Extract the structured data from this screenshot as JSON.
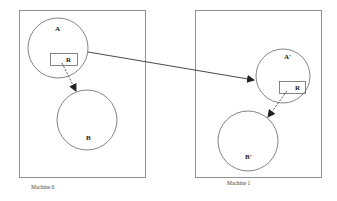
{
  "machines": [
    {
      "caption": "Machine 0",
      "process_top": "A",
      "process_bottom": "B",
      "ref": "R"
    },
    {
      "caption": "Machine 1",
      "process_top": "A'",
      "process_bottom": "B'",
      "ref": "R"
    }
  ],
  "colors": {
    "stroke": "#555555",
    "arrow": "#333333"
  }
}
